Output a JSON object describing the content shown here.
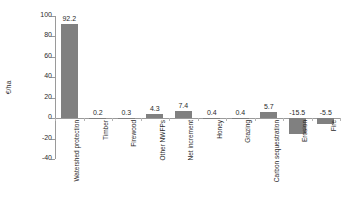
{
  "chart_data": {
    "type": "bar",
    "title": "",
    "xlabel": "",
    "ylabel": "€/ha",
    "ylim": [
      -40,
      100
    ],
    "ytick_step": 20,
    "grid": false,
    "legend": "none",
    "bar_color": "#808080",
    "axis_color": "#9a9a9a",
    "categories": [
      "Watershed protection",
      "Timber",
      "Firewood",
      "Other NWFPs",
      "Net increment",
      "Honey",
      "Grazing",
      "Carbon sequestration",
      "Erosion",
      "Fire"
    ],
    "values": [
      92.2,
      0.2,
      0.3,
      4.3,
      7.4,
      0.4,
      0.4,
      5.7,
      -15.5,
      -5.5
    ],
    "value_labels": [
      "92.2",
      "0.2",
      "0.3",
      "4.3",
      "7.4",
      "0.4",
      "0.4",
      "5.7",
      "-15.5",
      "-5.5"
    ],
    "ytick_labels": [
      "100",
      "80",
      "60",
      "40",
      "20",
      "0",
      "-20",
      "-40"
    ],
    "ytick_values": [
      100,
      80,
      60,
      40,
      20,
      0,
      -20,
      -40
    ]
  }
}
